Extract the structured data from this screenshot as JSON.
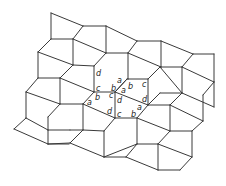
{
  "diagram": {
    "title": "",
    "type": "pentagonal tiling",
    "stroke_color": "#3a3a3a",
    "labels": [
      {
        "text": "d",
        "x": 96,
        "y": 76
      },
      {
        "text": "c",
        "x": 96,
        "y": 91
      },
      {
        "text": "b",
        "x": 111,
        "y": 91
      },
      {
        "text": "a",
        "x": 117,
        "y": 83
      },
      {
        "text": "a",
        "x": 121,
        "y": 93
      },
      {
        "text": "b",
        "x": 128,
        "y": 89
      },
      {
        "text": "c",
        "x": 142,
        "y": 87
      },
      {
        "text": "b",
        "x": 95,
        "y": 100
      },
      {
        "text": "a",
        "x": 87,
        "y": 105
      },
      {
        "text": "c",
        "x": 109,
        "y": 98
      },
      {
        "text": "d",
        "x": 117,
        "y": 103
      },
      {
        "text": "d",
        "x": 142,
        "y": 102
      },
      {
        "text": "a",
        "x": 137,
        "y": 110
      },
      {
        "text": "d",
        "x": 107,
        "y": 114
      },
      {
        "text": "c",
        "x": 117,
        "y": 117
      },
      {
        "text": "b",
        "x": 131,
        "y": 117
      }
    ],
    "edges": [
      [
        51,
        13,
        83,
        26
      ],
      [
        51,
        13,
        51,
        39
      ],
      [
        83,
        26,
        73,
        39
      ],
      [
        51,
        39,
        73,
        39
      ],
      [
        83,
        26,
        106,
        26
      ],
      [
        106,
        26,
        137,
        41
      ],
      [
        106,
        26,
        106,
        53
      ],
      [
        73,
        39,
        106,
        53
      ],
      [
        73,
        39,
        73,
        65
      ],
      [
        51,
        39,
        38,
        52
      ],
      [
        38,
        52,
        73,
        65
      ],
      [
        38,
        52,
        38,
        78
      ],
      [
        73,
        65,
        60,
        78
      ],
      [
        38,
        78,
        60,
        78
      ],
      [
        106,
        53,
        128,
        53
      ],
      [
        106,
        53,
        94,
        66
      ],
      [
        137,
        41,
        161,
        41
      ],
      [
        137,
        41,
        128,
        53
      ],
      [
        161,
        41,
        193,
        54
      ],
      [
        161,
        41,
        161,
        67
      ],
      [
        128,
        53,
        128,
        79
      ],
      [
        128,
        53,
        161,
        67
      ],
      [
        193,
        54,
        214,
        54
      ],
      [
        193,
        54,
        182,
        67
      ],
      [
        214,
        54,
        214,
        82
      ],
      [
        182,
        67,
        214,
        82
      ],
      [
        161,
        67,
        182,
        67
      ],
      [
        73,
        65,
        94,
        66
      ],
      [
        94,
        66,
        94,
        92
      ],
      [
        60,
        78,
        94,
        92
      ],
      [
        38,
        78,
        26,
        92
      ],
      [
        60,
        78,
        60,
        104
      ],
      [
        26,
        92,
        60,
        104
      ],
      [
        94,
        92,
        115,
        92
      ],
      [
        94,
        92,
        83,
        104
      ],
      [
        60,
        104,
        83,
        104
      ],
      [
        115,
        92,
        127,
        79
      ],
      [
        127,
        79,
        128,
        79
      ],
      [
        128,
        79,
        148,
        79
      ],
      [
        148,
        79,
        160,
        67
      ],
      [
        160,
        67,
        161,
        67
      ],
      [
        127,
        79,
        115,
        92
      ],
      [
        115,
        92,
        115,
        118
      ],
      [
        115,
        92,
        148,
        105
      ],
      [
        148,
        79,
        148,
        105
      ],
      [
        182,
        67,
        182,
        93
      ],
      [
        160,
        67,
        182,
        93
      ],
      [
        148,
        105,
        160,
        93
      ],
      [
        160,
        93,
        182,
        93
      ],
      [
        214,
        82,
        203,
        95
      ],
      [
        182,
        93,
        214,
        107
      ],
      [
        203,
        95,
        203,
        121
      ],
      [
        214,
        82,
        214,
        107
      ],
      [
        83,
        104,
        83,
        130
      ],
      [
        60,
        104,
        48,
        117
      ],
      [
        48,
        117,
        48,
        130
      ],
      [
        26,
        92,
        26,
        118
      ],
      [
        26,
        118,
        48,
        130
      ],
      [
        83,
        104,
        115,
        118
      ],
      [
        48,
        130,
        70,
        130
      ],
      [
        70,
        130,
        83,
        130
      ],
      [
        115,
        118,
        137,
        118
      ],
      [
        137,
        118,
        148,
        105
      ],
      [
        115,
        118,
        104,
        131
      ],
      [
        83,
        130,
        104,
        131
      ],
      [
        83,
        130,
        70,
        143
      ],
      [
        14,
        129,
        26,
        118
      ],
      [
        14,
        129,
        48,
        144
      ],
      [
        48,
        130,
        48,
        144
      ],
      [
        48,
        144,
        70,
        143
      ],
      [
        48,
        144,
        69,
        144
      ],
      [
        104,
        131,
        104,
        157
      ],
      [
        70,
        143,
        104,
        157
      ],
      [
        137,
        118,
        137,
        144
      ],
      [
        148,
        105,
        170,
        105
      ],
      [
        170,
        105,
        182,
        93
      ],
      [
        137,
        118,
        170,
        131
      ],
      [
        170,
        105,
        170,
        131
      ],
      [
        170,
        131,
        192,
        131
      ],
      [
        192,
        131,
        203,
        121
      ],
      [
        203,
        121,
        170,
        105
      ],
      [
        192,
        131,
        192,
        157
      ],
      [
        137,
        144,
        104,
        157
      ],
      [
        137,
        144,
        158,
        144
      ],
      [
        158,
        144,
        170,
        131
      ],
      [
        104,
        157,
        126,
        157
      ],
      [
        126,
        157,
        137,
        144
      ],
      [
        158,
        144,
        158,
        170
      ],
      [
        126,
        157,
        158,
        170
      ],
      [
        158,
        170,
        180,
        170
      ],
      [
        180,
        170,
        192,
        157
      ],
      [
        158,
        144,
        192,
        157
      ]
    ]
  }
}
